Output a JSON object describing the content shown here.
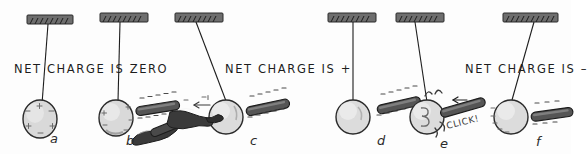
{
  "figure": {
    "title": "Charging a pith ball by induction and contact",
    "background": "#fdfdfd",
    "ink": "#1d1d1d",
    "rod_fill": "#555555",
    "ceiling_fill": "#6e6e6e",
    "ball_fill": "#d9d9d9",
    "hand_fill": "#3a3a3a"
  },
  "captions": [
    {
      "id": "cap-zero",
      "text": "NET CHARGE IS ZERO",
      "x": 14,
      "y": 62
    },
    {
      "id": "cap-plus",
      "text": "NET CHARGE IS +",
      "x": 225,
      "y": 62
    },
    {
      "id": "cap-minus",
      "text": "NET CHARGE IS –",
      "x": 465,
      "y": 62
    }
  ],
  "panels": [
    {
      "key": "a",
      "label": "a",
      "label_x": 50,
      "label_y": 131,
      "ball_charge": "neutral",
      "ball_marks": [
        "+",
        "−",
        "+",
        "−",
        "+",
        "−",
        "+",
        "−"
      ],
      "has_rod": false,
      "has_hand": false,
      "has_spark": false,
      "rod_charge": null,
      "description": "Uncharged suspended pith ball hanging straight down; charges evenly mixed, net charge zero."
    },
    {
      "key": "b",
      "label": "b",
      "label_x": 126,
      "label_y": 133,
      "ball_charge": "polarized",
      "ball_marks": [
        "−",
        "+",
        "−",
        "+"
      ],
      "has_rod": true,
      "has_hand": false,
      "has_spark": false,
      "rod_charge": "−",
      "rod_mark_count": 7,
      "description": "Negatively charged rod brought near the ball polarizes it; a second rod is being rubbed with fur below."
    },
    {
      "key": "c",
      "label": "c",
      "label_x": 250,
      "label_y": 133,
      "ball_charge": "polarized",
      "ball_marks": [
        "−",
        "+"
      ],
      "has_rod": true,
      "has_hand": true,
      "has_spark": false,
      "rod_charge": "−",
      "rod_mark_count": 7,
      "hand_arrow": "←",
      "description": "A finger touches the ball, grounding it; electrons flow away through the hand."
    },
    {
      "key": "d",
      "label": "d",
      "label_x": 377,
      "label_y": 133,
      "ball_charge": "+",
      "ball_marks": [],
      "has_rod": true,
      "has_hand": false,
      "has_spark": false,
      "rod_charge": "−",
      "rod_mark_count": 7,
      "description": "Hand removed; the ball is left with a net positive charge and is attracted toward the rod."
    },
    {
      "key": "e",
      "label": "e",
      "label_x": 440,
      "label_y": 136,
      "ball_charge": "+",
      "ball_marks": [],
      "has_rod": true,
      "has_hand": false,
      "has_spark": true,
      "spark_text": "CLICK!",
      "rod_charge": "−",
      "rod_mark_count": 0,
      "rod_arrow": "←",
      "description": "Rod touches the ball; charge transfers with an audible click spark."
    },
    {
      "key": "f",
      "label": "f",
      "label_x": 536,
      "label_y": 134,
      "ball_charge": "−",
      "ball_marks": [
        "−",
        "−",
        "−",
        "−",
        "−"
      ],
      "has_rod": true,
      "has_hand": false,
      "has_spark": false,
      "rod_charge": "−",
      "rod_mark_count": 5,
      "description": "After contact the ball carries a net negative charge and is repelled by the rod."
    }
  ]
}
